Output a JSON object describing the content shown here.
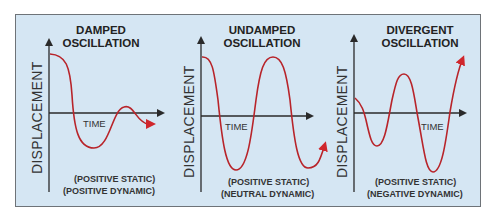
{
  "panels": [
    {
      "title_line1": "DAMPED",
      "title_line2": "OSCILLATION",
      "y_axis_label": "DISPLACEMENT",
      "x_axis_label": "TIME",
      "note_line1": "(POSITIVE STATIC)",
      "note_line2": "(POSITIVE DYNAMIC)"
    },
    {
      "title_line1": "UNDAMPED",
      "title_line2": "OSCILLATION",
      "y_axis_label": "DISPLACEMENT",
      "x_axis_label": "TIME",
      "note_line1": "(POSITIVE STATIC)",
      "note_line2": "(NEUTRAL DYNAMIC)"
    },
    {
      "title_line1": "DIVERGENT",
      "title_line2": "OSCILLATION",
      "y_axis_label": "DISPLACEMENT",
      "x_axis_label": "TIME",
      "note_line1": "(POSITIVE STATIC)",
      "note_line2": "(NEGATIVE DYNAMIC)"
    }
  ],
  "colors": {
    "background": "#d5e6f3",
    "curve": "#b8242a",
    "axis": "#333333"
  }
}
